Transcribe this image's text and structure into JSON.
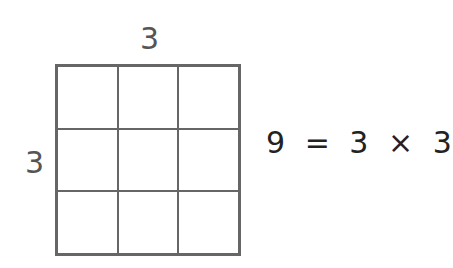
{
  "diagram": {
    "top_label": "3",
    "side_label": "3",
    "grid": {
      "rows": 3,
      "cols": 3,
      "line_color": "#666666"
    },
    "equation": {
      "result": "9",
      "equals": "=",
      "a": "3",
      "times": "×",
      "b": "3"
    }
  }
}
